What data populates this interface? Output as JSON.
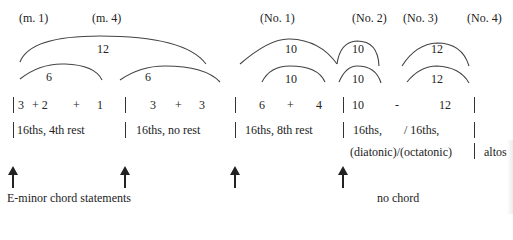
{
  "measure_labels": [
    "(m. 1)",
    "(m. 4)"
  ],
  "number_labels": [
    "(No. 1)",
    "(No. 2)",
    "(No. 3)",
    "(No. 4)"
  ],
  "arcs": {
    "outer": [
      "12",
      "10",
      "10",
      "12"
    ],
    "inner": [
      "6",
      "6",
      "10",
      "10",
      "12"
    ]
  },
  "groupings": [
    {
      "terms": [
        "3",
        "+ 2",
        "+",
        "1"
      ]
    },
    {
      "terms": [
        "3",
        "+",
        "3"
      ]
    },
    {
      "terms": [
        "6",
        "+",
        "4"
      ]
    },
    {
      "terms": [
        "10",
        "-",
        "12"
      ]
    }
  ],
  "rhythms": [
    "16ths, 4th rest",
    "16ths, no rest",
    "16ths, 8th rest",
    "16ths,",
    "/ 16ths,"
  ],
  "modes": "(diatonic)/(octatonic)",
  "altos": "altos",
  "annotations": {
    "chord_statements": "E-minor chord statements",
    "no_chord": "no chord"
  },
  "colors": {
    "ink": "#222222",
    "line": "#333333",
    "background": "#ffffff"
  }
}
